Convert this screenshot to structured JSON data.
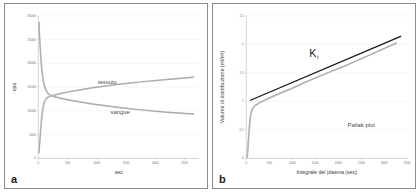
{
  "figure": {
    "panels": [
      {
        "id": "a",
        "label": "a",
        "xlabel": "sec",
        "ylabel": "cps"
      },
      {
        "id": "b",
        "label": "b",
        "xlabel": "Integrale del plasma (sec)",
        "ylabel": "Volume di distribuzione (ml/ml)"
      }
    ]
  },
  "chart_data": [
    {
      "type": "line",
      "panel": "a",
      "title": "",
      "xlabel": "sec",
      "ylabel": "cps",
      "xlim": [
        0,
        2750
      ],
      "ylim": [
        0,
        30000
      ],
      "xticks": [
        0,
        500,
        1000,
        1500,
        2000,
        2500
      ],
      "xticklabels": [
        "0",
        "500",
        "1000",
        "1500",
        "2000",
        "2500"
      ],
      "yticks": [
        0,
        5000,
        10000,
        15000,
        20000,
        25000,
        30000
      ],
      "yticklabels": [
        "0",
        "5000",
        "10000",
        "15000",
        "20000",
        "25000",
        "30000"
      ],
      "grid": "horizontal",
      "legend": "inline-annotations",
      "annotations": [
        {
          "text": "tessuto",
          "x": 1180,
          "y": 15600
        },
        {
          "text": "sangue",
          "x": 1400,
          "y": 9250
        }
      ],
      "series": [
        {
          "name": "sangue",
          "color": "#a9a9b2",
          "x": [
            10,
            25,
            40,
            55,
            70,
            85,
            100,
            120,
            145,
            175,
            215,
            265,
            330,
            420,
            540,
            700,
            900,
            1150,
            1450,
            1800,
            2150,
            2450,
            2650
          ],
          "y": [
            28600,
            24800,
            21600,
            19300,
            17600,
            16400,
            15500,
            14700,
            14050,
            13550,
            13200,
            13000,
            12800,
            12550,
            12250,
            11900,
            11500,
            11050,
            10600,
            10150,
            9750,
            9500,
            9350
          ]
        },
        {
          "name": "tessuto",
          "color": "#a9a9b2",
          "x": [
            10,
            25,
            40,
            55,
            70,
            85,
            100,
            120,
            145,
            175,
            215,
            265,
            330,
            420,
            540,
            700,
            900,
            1150,
            1450,
            1800,
            2150,
            2450,
            2650
          ],
          "y": [
            1250,
            3600,
            6100,
            8200,
            9800,
            10950,
            11700,
            12300,
            12700,
            12950,
            13150,
            13300,
            13500,
            13750,
            14050,
            14400,
            14800,
            15250,
            15700,
            16150,
            16550,
            16850,
            17050
          ]
        }
      ]
    },
    {
      "type": "scatter",
      "panel": "b",
      "title": "Patlak plot",
      "xlabel": "Integrale del plasma (sec)",
      "ylabel": "Volume di distribuzione (ml/ml)",
      "xlim": [
        0,
        3500
      ],
      "ylim": [
        0,
        2.5
      ],
      "xticks": [
        0,
        500,
        1000,
        1500,
        2000,
        2500,
        3000,
        3500
      ],
      "xticklabels": [
        "0",
        "500",
        "1000",
        "1500",
        "2000",
        "2500",
        "3000",
        "3500"
      ],
      "yticks": [
        0,
        0.5,
        1,
        1.5,
        2,
        2.5
      ],
      "yticklabels": [
        "0",
        "0.5",
        "1",
        "1.5",
        "2",
        "2.5"
      ],
      "grid": "horizontal",
      "annotations": [
        {
          "text": "K",
          "subscript": "i",
          "x": 1450,
          "y": 1.78
        },
        {
          "text": "Patlak plot",
          "x": 2500,
          "y": 0.55
        }
      ],
      "series": [
        {
          "name": "dati",
          "color": "#bdbdc6",
          "x": [
            15,
            20,
            25,
            30,
            36,
            42,
            48,
            55,
            62,
            70,
            78,
            86,
            95,
            105,
            118,
            135,
            160,
            200,
            275,
            400,
            560,
            760,
            1000,
            1270,
            1560,
            1860,
            2170,
            2480,
            2790,
            3090,
            3260
          ],
          "y": [
            0.02,
            0.05,
            0.09,
            0.14,
            0.2,
            0.27,
            0.34,
            0.42,
            0.5,
            0.58,
            0.65,
            0.71,
            0.76,
            0.8,
            0.84,
            0.87,
            0.9,
            0.93,
            0.97,
            1.02,
            1.08,
            1.15,
            1.23,
            1.33,
            1.43,
            1.53,
            1.63,
            1.74,
            1.85,
            1.96,
            2.02
          ]
        }
      ],
      "fit": {
        "name": "regressione Ki",
        "color": "#121212",
        "x": [
          90,
          3360
        ],
        "y": [
          1.02,
          2.14
        ]
      }
    }
  ]
}
